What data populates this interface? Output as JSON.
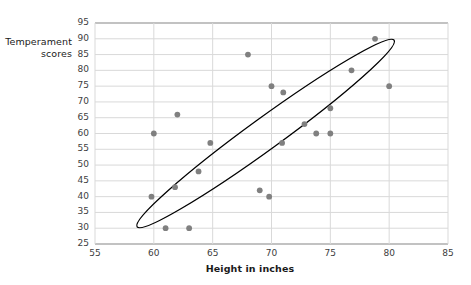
{
  "chart_data": {
    "type": "scatter",
    "title": "",
    "xlabel": "Height in inches",
    "ylabel": "Temperament\nscores",
    "xlim": [
      55,
      85
    ],
    "ylim": [
      25,
      95
    ],
    "xticks": [
      55,
      60,
      65,
      70,
      75,
      80,
      85
    ],
    "yticks": [
      25,
      30,
      35,
      40,
      45,
      50,
      55,
      60,
      65,
      70,
      75,
      80,
      85,
      90,
      95
    ],
    "grid": "horizontal-and-vertical",
    "legend": "none",
    "point_color": "#808080",
    "grid_color": "#d9d9d9",
    "annotation_color": "#000000",
    "points": [
      {
        "x": 59.8,
        "y": 40
      },
      {
        "x": 60.0,
        "y": 60
      },
      {
        "x": 61.0,
        "y": 30
      },
      {
        "x": 61.8,
        "y": 43
      },
      {
        "x": 62.0,
        "y": 66
      },
      {
        "x": 63.0,
        "y": 30
      },
      {
        "x": 63.8,
        "y": 48
      },
      {
        "x": 64.8,
        "y": 57
      },
      {
        "x": 68.0,
        "y": 85
      },
      {
        "x": 69.0,
        "y": 42
      },
      {
        "x": 69.8,
        "y": 40
      },
      {
        "x": 70.0,
        "y": 75
      },
      {
        "x": 71.0,
        "y": 73
      },
      {
        "x": 70.9,
        "y": 57
      },
      {
        "x": 72.8,
        "y": 63
      },
      {
        "x": 73.8,
        "y": 60
      },
      {
        "x": 75.0,
        "y": 60
      },
      {
        "x": 75.0,
        "y": 68
      },
      {
        "x": 76.8,
        "y": 80
      },
      {
        "x": 78.8,
        "y": 90
      },
      {
        "x": 80.0,
        "y": 75
      }
    ],
    "annotations": [
      {
        "type": "ellipse",
        "label": "correlation-ellipse",
        "center_x": 69.5,
        "center_y": 60,
        "rx": 13.5,
        "ry": 5.0,
        "rotation_deg": -36
      }
    ]
  }
}
